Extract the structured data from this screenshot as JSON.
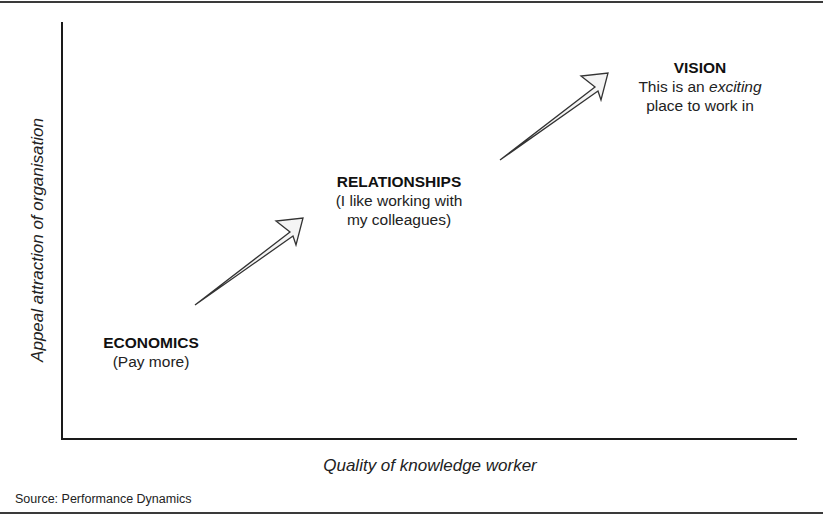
{
  "diagram": {
    "y_axis_label": "Appeal attraction of organisation",
    "x_axis_label": "Quality of knowledge worker",
    "source": "Source: Performance Dynamics",
    "nodes": [
      {
        "title": "ECONOMICS",
        "lines": [
          "(Pay more)"
        ]
      },
      {
        "title": "RELATIONSHIPS",
        "lines": [
          "(I like working with",
          "my colleagues)"
        ]
      },
      {
        "title": "VISION",
        "line1_prefix": "This is an ",
        "line1_emphasis": "exciting",
        "line2": "place to work in"
      }
    ],
    "arrows": [
      {
        "from": "ECONOMICS",
        "to": "RELATIONSHIPS"
      },
      {
        "from": "RELATIONSHIPS",
        "to": "VISION"
      }
    ],
    "colors": {
      "axis": "#1a1a1a",
      "arrow_stroke": "#333333",
      "arrow_fill": "#f4f4f4",
      "rule": "#3a3a3a"
    }
  }
}
